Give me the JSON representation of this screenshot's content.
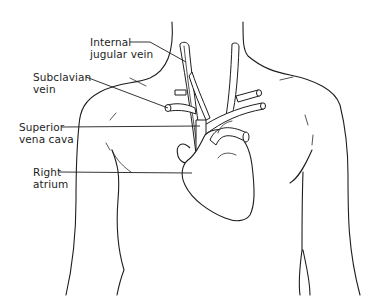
{
  "diagram": {
    "labels": [
      {
        "id": "internal-jugular-vein",
        "text": "Internal\njugular vein",
        "x": 90,
        "y": 38
      },
      {
        "id": "subclavian-vein",
        "text": "Subclavian\nvein",
        "x": 33,
        "y": 71
      },
      {
        "id": "superior-vena-cava",
        "text": "Superior\nvena cava",
        "x": 19,
        "y": 122
      },
      {
        "id": "right-atrium",
        "text": "Right\natrium",
        "x": 33,
        "y": 161
      }
    ],
    "colors": {
      "line": "#1e1e1e",
      "background": "#ffffff"
    }
  }
}
